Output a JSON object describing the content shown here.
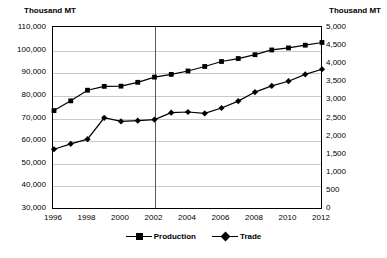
{
  "chart_data": {
    "type": "line",
    "title": "",
    "left_axis_title": "Thousand MT",
    "right_axis_title": "Thousand MT",
    "xlabel": "",
    "x": [
      1996,
      1997,
      1998,
      1999,
      2000,
      2001,
      2002,
      2003,
      2004,
      2005,
      2006,
      2007,
      2008,
      2009,
      2010,
      2011,
      2012
    ],
    "xtick_labels": [
      "1996",
      "1998",
      "2000",
      "2002",
      "2004",
      "2006",
      "2008",
      "2010",
      "2012"
    ],
    "xtick_values": [
      1996,
      1998,
      2000,
      2002,
      2004,
      2006,
      2008,
      2010,
      2012
    ],
    "ylim_left": [
      30000,
      110000
    ],
    "ytick_labels_left": [
      "30,000",
      "40,000",
      "50,000",
      "60,000",
      "70,000",
      "80,000",
      "90,000",
      "100,000",
      "110,000"
    ],
    "ytick_values_left": [
      30000,
      40000,
      50000,
      60000,
      70000,
      80000,
      90000,
      100000,
      110000
    ],
    "ylim_right": [
      0,
      5000
    ],
    "ytick_labels_right": [
      "0",
      "500",
      "1,000",
      "1,500",
      "2,000",
      "2,500",
      "3,000",
      "3,500",
      "4,000",
      "4,500",
      "5,000"
    ],
    "ytick_values_right": [
      0,
      500,
      1000,
      1500,
      2000,
      2500,
      3000,
      3500,
      4000,
      4500,
      5000
    ],
    "grid": "horizontal",
    "legend_position": "bottom",
    "annotations": [
      {
        "name": "vertical-divider",
        "x": 2002
      }
    ],
    "series": [
      {
        "name": "Production",
        "axis": "left",
        "color": "#000000",
        "marker": "square",
        "values": [
          73500,
          77800,
          82500,
          84200,
          84300,
          86000,
          88300,
          89500,
          91000,
          93000,
          95200,
          96500,
          98200,
          100300,
          101200,
          102400,
          103600
        ]
      },
      {
        "name": "Trade",
        "axis": "right",
        "color": "#000000",
        "marker": "diamond",
        "values": [
          1650,
          1800,
          1930,
          2520,
          2420,
          2440,
          2470,
          2660,
          2680,
          2640,
          2790,
          2980,
          3230,
          3400,
          3530,
          3720,
          3860
        ]
      }
    ]
  },
  "legend": {
    "items": [
      {
        "label": "Production",
        "marker": "square"
      },
      {
        "label": "Trade",
        "marker": "diamond"
      }
    ]
  }
}
